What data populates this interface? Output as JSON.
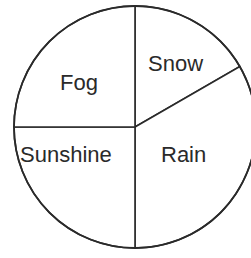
{
  "chart_data": {
    "type": "pie",
    "title": "",
    "categories": [
      "Snow",
      "Rain",
      "Sunshine",
      "Fog"
    ],
    "values": [
      60,
      120,
      90,
      90
    ],
    "units": "degrees",
    "fractions": [
      0.1667,
      0.3333,
      0.25,
      0.25
    ],
    "percentages": [
      16.7,
      33.3,
      25,
      25
    ],
    "legend": "none (labels inside slices)",
    "colors": {
      "fill": "#ffffff",
      "stroke": "#2a2a2a",
      "text": "#2a2a2a"
    }
  },
  "labels": {
    "snow": "Snow",
    "rain": "Rain",
    "sunshine": "Sunshine",
    "fog": "Fog"
  }
}
